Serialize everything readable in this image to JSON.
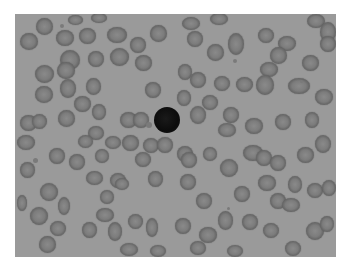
{
  "image": {
    "description": "Grayscale micrograph of a blood smear: many red blood cells with one dark lymphocyte near center",
    "frame": {
      "x": 15,
      "y": 14,
      "width": 321,
      "height": 243
    },
    "background_color": "#9a9a9a",
    "border_color": "#ffffff"
  },
  "nucleus": {
    "x": 154,
    "y": 107,
    "w": 26,
    "h": 26
  },
  "platelets": [
    {
      "x": 146,
      "y": 122,
      "w": 6,
      "h": 6
    },
    {
      "x": 60,
      "y": 24,
      "w": 4,
      "h": 4
    },
    {
      "x": 233,
      "y": 59,
      "w": 4,
      "h": 4
    },
    {
      "x": 33,
      "y": 158,
      "w": 5,
      "h": 5
    },
    {
      "x": 300,
      "y": 80,
      "w": 3,
      "h": 3
    },
    {
      "x": 227,
      "y": 207,
      "w": 3,
      "h": 3
    }
  ],
  "cells": [
    {
      "x": 20,
      "y": 33,
      "w": 18,
      "h": 17
    },
    {
      "x": 36,
      "y": 18,
      "w": 17,
      "h": 17
    },
    {
      "x": 56,
      "y": 30,
      "w": 18,
      "h": 16
    },
    {
      "x": 79,
      "y": 28,
      "w": 17,
      "h": 16
    },
    {
      "x": 107,
      "y": 27,
      "w": 20,
      "h": 16
    },
    {
      "x": 130,
      "y": 37,
      "w": 16,
      "h": 16
    },
    {
      "x": 150,
      "y": 25,
      "w": 17,
      "h": 17
    },
    {
      "x": 68,
      "y": 15,
      "w": 15,
      "h": 10
    },
    {
      "x": 91,
      "y": 13,
      "w": 16,
      "h": 10
    },
    {
      "x": 60,
      "y": 50,
      "w": 20,
      "h": 20
    },
    {
      "x": 57,
      "y": 62,
      "w": 18,
      "h": 17
    },
    {
      "x": 88,
      "y": 51,
      "w": 16,
      "h": 16
    },
    {
      "x": 110,
      "y": 48,
      "w": 19,
      "h": 18
    },
    {
      "x": 135,
      "y": 55,
      "w": 17,
      "h": 16
    },
    {
      "x": 35,
      "y": 65,
      "w": 19,
      "h": 18
    },
    {
      "x": 35,
      "y": 86,
      "w": 18,
      "h": 17
    },
    {
      "x": 60,
      "y": 79,
      "w": 16,
      "h": 19
    },
    {
      "x": 86,
      "y": 78,
      "w": 15,
      "h": 17
    },
    {
      "x": 145,
      "y": 82,
      "w": 16,
      "h": 16
    },
    {
      "x": 74,
      "y": 96,
      "w": 17,
      "h": 16
    },
    {
      "x": 92,
      "y": 104,
      "w": 14,
      "h": 16
    },
    {
      "x": 58,
      "y": 110,
      "w": 17,
      "h": 17
    },
    {
      "x": 20,
      "y": 115,
      "w": 17,
      "h": 16
    },
    {
      "x": 32,
      "y": 114,
      "w": 15,
      "h": 15
    },
    {
      "x": 120,
      "y": 112,
      "w": 17,
      "h": 16
    },
    {
      "x": 133,
      "y": 112,
      "w": 16,
      "h": 16
    },
    {
      "x": 88,
      "y": 126,
      "w": 16,
      "h": 14
    },
    {
      "x": 182,
      "y": 17,
      "w": 18,
      "h": 13
    },
    {
      "x": 210,
      "y": 13,
      "w": 18,
      "h": 12
    },
    {
      "x": 187,
      "y": 31,
      "w": 16,
      "h": 16
    },
    {
      "x": 207,
      "y": 44,
      "w": 17,
      "h": 17
    },
    {
      "x": 228,
      "y": 33,
      "w": 16,
      "h": 22
    },
    {
      "x": 258,
      "y": 28,
      "w": 16,
      "h": 15
    },
    {
      "x": 278,
      "y": 36,
      "w": 18,
      "h": 15
    },
    {
      "x": 270,
      "y": 47,
      "w": 17,
      "h": 17
    },
    {
      "x": 307,
      "y": 14,
      "w": 18,
      "h": 14
    },
    {
      "x": 320,
      "y": 22,
      "w": 16,
      "h": 20
    },
    {
      "x": 320,
      "y": 36,
      "w": 16,
      "h": 16
    },
    {
      "x": 302,
      "y": 55,
      "w": 17,
      "h": 16
    },
    {
      "x": 260,
      "y": 62,
      "w": 18,
      "h": 15
    },
    {
      "x": 178,
      "y": 64,
      "w": 14,
      "h": 16
    },
    {
      "x": 190,
      "y": 72,
      "w": 16,
      "h": 16
    },
    {
      "x": 214,
      "y": 76,
      "w": 16,
      "h": 15
    },
    {
      "x": 236,
      "y": 77,
      "w": 17,
      "h": 15
    },
    {
      "x": 256,
      "y": 75,
      "w": 18,
      "h": 20
    },
    {
      "x": 288,
      "y": 78,
      "w": 22,
      "h": 16
    },
    {
      "x": 177,
      "y": 90,
      "w": 14,
      "h": 16
    },
    {
      "x": 202,
      "y": 95,
      "w": 16,
      "h": 15
    },
    {
      "x": 315,
      "y": 89,
      "w": 18,
      "h": 16
    },
    {
      "x": 190,
      "y": 106,
      "w": 16,
      "h": 18
    },
    {
      "x": 223,
      "y": 107,
      "w": 16,
      "h": 16
    },
    {
      "x": 245,
      "y": 118,
      "w": 18,
      "h": 16
    },
    {
      "x": 218,
      "y": 123,
      "w": 18,
      "h": 14
    },
    {
      "x": 275,
      "y": 114,
      "w": 16,
      "h": 16
    },
    {
      "x": 305,
      "y": 112,
      "w": 14,
      "h": 16
    },
    {
      "x": 17,
      "y": 135,
      "w": 18,
      "h": 15
    },
    {
      "x": 20,
      "y": 162,
      "w": 15,
      "h": 16
    },
    {
      "x": 49,
      "y": 148,
      "w": 16,
      "h": 16
    },
    {
      "x": 69,
      "y": 154,
      "w": 16,
      "h": 16
    },
    {
      "x": 78,
      "y": 135,
      "w": 15,
      "h": 13
    },
    {
      "x": 95,
      "y": 149,
      "w": 14,
      "h": 14
    },
    {
      "x": 105,
      "y": 136,
      "w": 16,
      "h": 13
    },
    {
      "x": 122,
      "y": 135,
      "w": 17,
      "h": 16
    },
    {
      "x": 143,
      "y": 138,
      "w": 16,
      "h": 15
    },
    {
      "x": 157,
      "y": 137,
      "w": 16,
      "h": 16
    },
    {
      "x": 135,
      "y": 152,
      "w": 16,
      "h": 15
    },
    {
      "x": 86,
      "y": 171,
      "w": 17,
      "h": 14
    },
    {
      "x": 110,
      "y": 173,
      "w": 16,
      "h": 15
    },
    {
      "x": 115,
      "y": 178,
      "w": 14,
      "h": 12
    },
    {
      "x": 100,
      "y": 190,
      "w": 14,
      "h": 14
    },
    {
      "x": 40,
      "y": 183,
      "w": 18,
      "h": 18
    },
    {
      "x": 58,
      "y": 197,
      "w": 12,
      "h": 18
    },
    {
      "x": 30,
      "y": 207,
      "w": 18,
      "h": 18
    },
    {
      "x": 17,
      "y": 195,
      "w": 10,
      "h": 16
    },
    {
      "x": 50,
      "y": 221,
      "w": 16,
      "h": 15
    },
    {
      "x": 39,
      "y": 236,
      "w": 17,
      "h": 17
    },
    {
      "x": 82,
      "y": 222,
      "w": 15,
      "h": 16
    },
    {
      "x": 96,
      "y": 208,
      "w": 18,
      "h": 14
    },
    {
      "x": 108,
      "y": 222,
      "w": 14,
      "h": 19
    },
    {
      "x": 128,
      "y": 214,
      "w": 15,
      "h": 15
    },
    {
      "x": 146,
      "y": 218,
      "w": 12,
      "h": 19
    },
    {
      "x": 120,
      "y": 243,
      "w": 18,
      "h": 13
    },
    {
      "x": 148,
      "y": 171,
      "w": 15,
      "h": 16
    },
    {
      "x": 177,
      "y": 146,
      "w": 16,
      "h": 16
    },
    {
      "x": 181,
      "y": 152,
      "w": 16,
      "h": 16
    },
    {
      "x": 203,
      "y": 147,
      "w": 14,
      "h": 14
    },
    {
      "x": 220,
      "y": 159,
      "w": 18,
      "h": 18
    },
    {
      "x": 243,
      "y": 145,
      "w": 20,
      "h": 16
    },
    {
      "x": 256,
      "y": 150,
      "w": 16,
      "h": 16
    },
    {
      "x": 270,
      "y": 155,
      "w": 16,
      "h": 16
    },
    {
      "x": 297,
      "y": 147,
      "w": 17,
      "h": 16
    },
    {
      "x": 315,
      "y": 135,
      "w": 16,
      "h": 18
    },
    {
      "x": 180,
      "y": 174,
      "w": 16,
      "h": 16
    },
    {
      "x": 234,
      "y": 186,
      "w": 16,
      "h": 16
    },
    {
      "x": 258,
      "y": 175,
      "w": 18,
      "h": 16
    },
    {
      "x": 288,
      "y": 176,
      "w": 14,
      "h": 17
    },
    {
      "x": 307,
      "y": 183,
      "w": 16,
      "h": 15
    },
    {
      "x": 322,
      "y": 180,
      "w": 14,
      "h": 16
    },
    {
      "x": 196,
      "y": 193,
      "w": 16,
      "h": 16
    },
    {
      "x": 270,
      "y": 193,
      "w": 16,
      "h": 16
    },
    {
      "x": 282,
      "y": 198,
      "w": 18,
      "h": 14
    },
    {
      "x": 175,
      "y": 218,
      "w": 16,
      "h": 16
    },
    {
      "x": 218,
      "y": 211,
      "w": 15,
      "h": 19
    },
    {
      "x": 242,
      "y": 214,
      "w": 16,
      "h": 16
    },
    {
      "x": 263,
      "y": 223,
      "w": 16,
      "h": 15
    },
    {
      "x": 306,
      "y": 222,
      "w": 18,
      "h": 18
    },
    {
      "x": 320,
      "y": 216,
      "w": 14,
      "h": 16
    },
    {
      "x": 199,
      "y": 227,
      "w": 18,
      "h": 16
    },
    {
      "x": 190,
      "y": 241,
      "w": 16,
      "h": 14
    },
    {
      "x": 227,
      "y": 245,
      "w": 16,
      "h": 12
    },
    {
      "x": 285,
      "y": 241,
      "w": 16,
      "h": 15
    },
    {
      "x": 150,
      "y": 245,
      "w": 16,
      "h": 12
    }
  ]
}
